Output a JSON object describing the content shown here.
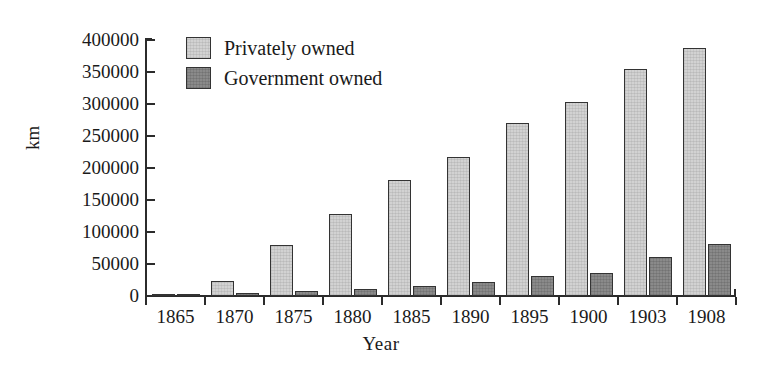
{
  "chart_data": {
    "type": "bar",
    "title": "",
    "xlabel": "Year",
    "ylabel": "km",
    "categories": [
      "1865",
      "1870",
      "1875",
      "1880",
      "1885",
      "1890",
      "1895",
      "1900",
      "1903",
      "1908"
    ],
    "series": [
      {
        "name": "Privately owned",
        "color": "#d2d2d2",
        "values": [
          3000,
          24000,
          80000,
          128000,
          181000,
          217000,
          270000,
          303000,
          355000,
          388000
        ]
      },
      {
        "name": "Government owned",
        "color": "#8a8a8a",
        "values": [
          1000,
          5000,
          8000,
          11000,
          15000,
          22000,
          31000,
          36000,
          61000,
          81000
        ]
      }
    ],
    "ylim": [
      0,
      400000
    ],
    "y_ticks": [
      0,
      50000,
      100000,
      150000,
      200000,
      250000,
      300000,
      350000,
      400000
    ],
    "y_tick_labels": [
      "0",
      "50000",
      "100000",
      "150000",
      "200000",
      "250000",
      "300000",
      "350000",
      "400000"
    ],
    "grid": false,
    "legend_position": "top-left",
    "legend": [
      "Privately owned",
      "Government owned"
    ]
  },
  "axes": {
    "x_title": "Year",
    "y_title": "km"
  }
}
